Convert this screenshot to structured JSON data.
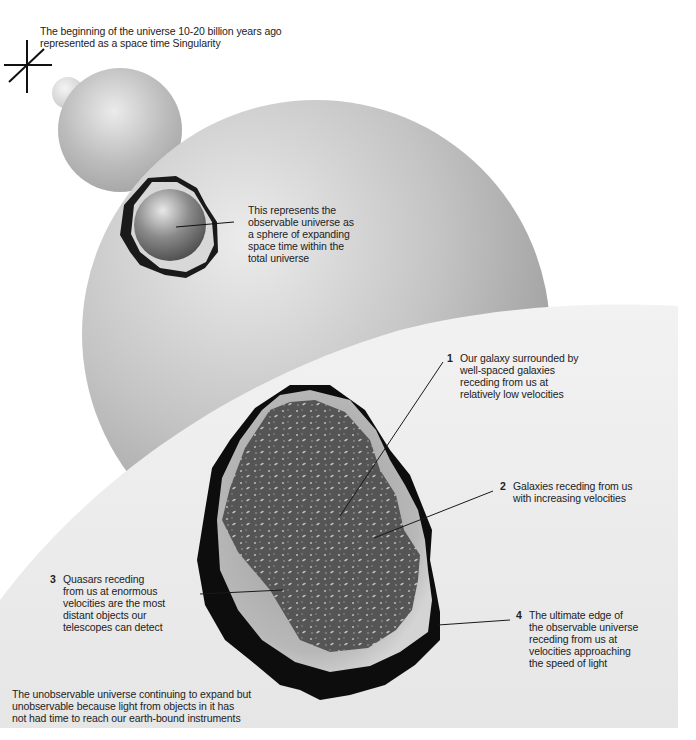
{
  "diagram": {
    "colors": {
      "background": "#ffffff",
      "sphere_light": "#eeeeee",
      "sphere_mid": "#bdbdbd",
      "sphere_dark": "#8a8a8a",
      "cutaway_shadow": "#111111",
      "galaxy_field": "#5a5a5a",
      "leader_line": "#1a1a1a"
    },
    "annotations": {
      "singularity": "The beginning of the universe 10-20 billion years ago\nrepresented as a space time Singularity",
      "observable_universe": "This represents the\nobservable universe as\na sphere of expanding\nspace time within the\ntotal universe",
      "unobservable": "The unobservable universe continuing to expand but\nunobservable because light from objects in it has\nnot had time to reach our earth-bound instruments"
    },
    "callouts": [
      {
        "number": "1",
        "text": "Our galaxy surrounded by\nwell-spaced galaxies\nreceding from us at\nrelatively low velocities"
      },
      {
        "number": "2",
        "text": "Galaxies receding from us\nwith increasing velocities"
      },
      {
        "number": "3",
        "text": "Quasars receding\nfrom us at enormous\nvelocities are the most\ndistant objects our\ntelescopes can detect"
      },
      {
        "number": "4",
        "text": "The ultimate edge of\nthe observable universe\nreceding from us at\nvelocities approaching\nthe speed of light"
      }
    ]
  }
}
